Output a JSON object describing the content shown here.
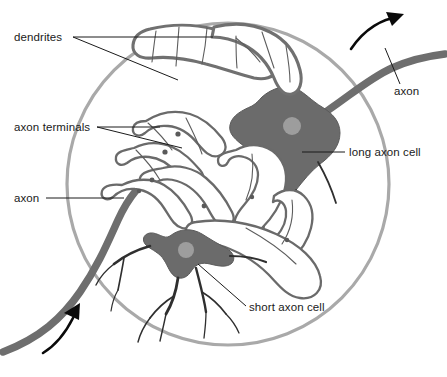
{
  "figure": {
    "background_color": "#ffffff",
    "circle": {
      "name": "tissue-field-boundary",
      "stroke_color": "#a9a9a9",
      "center_x": 228,
      "center_y": 184,
      "radius": 161
    },
    "colors": {
      "soma_fill": "#6b6b6b",
      "nucleus_fill": "#9d9d9d",
      "axon_stroke": "#6e6e6e",
      "dendrite_stroke": "#707070",
      "branch_stroke": "#2f2f2f",
      "label_text": "#1a1a1a",
      "leader_line": "#1a1a1a",
      "flow_arrow": "#0a0a0a"
    }
  },
  "labels": [
    {
      "id": "dendrites",
      "text": "dendrites",
      "x": 14,
      "y": 41,
      "anchor": "start",
      "leader_count": 2
    },
    {
      "id": "axon-terminals",
      "text": "axon terminals",
      "x": 14,
      "y": 130,
      "anchor": "start",
      "leader_count": 2
    },
    {
      "id": "axon-left",
      "text": "axon",
      "x": 14,
      "y": 202,
      "anchor": "start",
      "leader_count": 1
    },
    {
      "id": "long-axon-cell",
      "text": "long axon cell",
      "x": 349,
      "y": 155,
      "anchor": "start",
      "leader_count": 1
    },
    {
      "id": "short-axon-cell",
      "text": "short axon cell",
      "x": 249,
      "y": 311,
      "anchor": "start",
      "leader_count": 1
    },
    {
      "id": "axon-right",
      "text": "axon",
      "x": 394,
      "y": 95,
      "anchor": "start",
      "leader_count": 1
    }
  ],
  "cells": [
    {
      "id": "long-axon-cell",
      "name": "long axon cell",
      "soma_center_x": 300,
      "soma_center_y": 132,
      "nucleus_x": 292,
      "nucleus_y": 126,
      "nucleus_r": 9
    },
    {
      "id": "short-axon-cell",
      "name": "short axon cell",
      "soma_center_x": 193,
      "soma_center_y": 256,
      "nucleus_x": 186,
      "nucleus_y": 250,
      "nucleus_r": 8
    }
  ],
  "flow_arrows": [
    {
      "id": "arrow-top-right",
      "direction": "up-right",
      "description": "signal leaving along long axon"
    },
    {
      "id": "arrow-bottom-left",
      "direction": "up-right",
      "description": "signal entering along incoming axon"
    }
  ]
}
